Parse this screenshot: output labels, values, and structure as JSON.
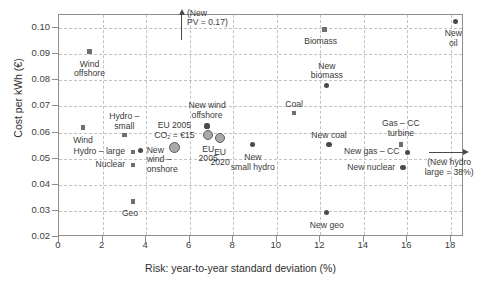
{
  "chart_data": {
    "type": "scatter",
    "title": "",
    "xlabel": "Risk: year-to-year standard deviation (%)",
    "ylabel": "Cost per kWh (€)",
    "xlim": [
      0,
      18.6
    ],
    "ylim": [
      0.02,
      0.105
    ],
    "grid": true,
    "legend": "none",
    "xticks": [
      "0",
      "2",
      "4",
      "6",
      "8",
      "10",
      "12",
      "14",
      "16",
      "18"
    ],
    "xtick_values": [
      0,
      2,
      4,
      6,
      8,
      10,
      12,
      14,
      16,
      18
    ],
    "yticks": [
      "0.10",
      "0.09",
      "0.08",
      "0.07",
      "0.06",
      "0.05",
      "0.04",
      "0.03",
      "0.02"
    ],
    "ytick_values": [
      0.1,
      0.09,
      0.08,
      0.07,
      0.06,
      0.05,
      0.04,
      0.03,
      0.02
    ],
    "series": [
      {
        "name": "Existing technologies",
        "marker": "square",
        "color": "#6e6e6e",
        "points": [
          {
            "label": "Wind\noffshore",
            "x": 1.4,
            "y": 0.091,
            "label_pos": "below",
            "label_dx": 0,
            "label_dy": 6
          },
          {
            "label": "Wind",
            "x": 1.1,
            "y": 0.062,
            "label_pos": "below",
            "label_dx": 0,
            "label_dy": 6
          },
          {
            "label": "Hydro –\nsmall",
            "x": 3.0,
            "y": 0.059,
            "label_pos": "above",
            "label_dx": 0,
            "label_dy": -23
          },
          {
            "label": "Hydro – large",
            "x": 3.4,
            "y": 0.0525,
            "label_pos": "left",
            "label_dx": -6,
            "label_dy": -5
          },
          {
            "label": "Nuclear",
            "x": 3.4,
            "y": 0.0475,
            "label_pos": "left",
            "label_dx": -6,
            "label_dy": -5
          },
          {
            "label": "Geo",
            "x": 3.4,
            "y": 0.0335,
            "label_pos": "below",
            "label_dx": -3,
            "label_dy": 5
          },
          {
            "label": "Biomass",
            "x": 12.2,
            "y": 0.0995,
            "label_pos": "below",
            "label_dx": -4,
            "label_dy": 5
          },
          {
            "label": "Coal",
            "x": 10.8,
            "y": 0.0675,
            "label_pos": "above",
            "label_dx": 0,
            "label_dy": -13
          },
          {
            "label": "Gas – CC\nturbine",
            "x": 15.7,
            "y": 0.0555,
            "label_pos": "above",
            "label_dx": 0,
            "label_dy": -25
          }
        ]
      },
      {
        "name": "New technologies",
        "marker": "circle",
        "color": "#4a4a4a",
        "points": [
          {
            "label": "New\nwind –\nonshore",
            "x": 3.75,
            "y": 0.053,
            "label_pos": "right",
            "label_dx": 6,
            "label_dy": -5
          },
          {
            "label": "New wind\noffshore",
            "x": 6.8,
            "y": 0.0625,
            "label_pos": "above",
            "label_dx": 0,
            "label_dy": -25
          },
          {
            "label": "New\nsmall hydro",
            "x": 8.9,
            "y": 0.0555,
            "label_pos": "below",
            "label_dx": 0,
            "label_dy": 6
          },
          {
            "label": "New\nbiomass",
            "x": 12.3,
            "y": 0.078,
            "label_pos": "above",
            "label_dx": 0,
            "label_dy": -24
          },
          {
            "label": "New coal",
            "x": 12.4,
            "y": 0.0555,
            "label_pos": "above",
            "label_dx": 0,
            "label_dy": -13
          },
          {
            "label": "New geo",
            "x": 12.3,
            "y": 0.0295,
            "label_pos": "below",
            "label_dx": 0,
            "label_dy": 6
          },
          {
            "label": "New gas – CC",
            "x": 16.0,
            "y": 0.0525,
            "label_pos": "left",
            "label_dx": -6,
            "label_dy": -5
          },
          {
            "label": "New nuclear",
            "x": 15.8,
            "y": 0.0465,
            "label_pos": "left",
            "label_dx": -6,
            "label_dy": -5
          },
          {
            "label": "New\noil",
            "x": 18.2,
            "y": 0.1025,
            "label_pos": "below",
            "label_dx": -2,
            "label_dy": 5
          }
        ]
      },
      {
        "name": "EU portfolios",
        "marker": "bigcircle",
        "color": "#a9a9a9",
        "points": [
          {
            "label": "EU 2005\nCO₂ = €15",
            "x": 5.3,
            "y": 0.0543,
            "label_pos": "above",
            "label_dx": 0,
            "label_dy": -26,
            "size": 11
          },
          {
            "label": "EU\n2005",
            "x": 6.85,
            "y": 0.0592,
            "label_pos": "below",
            "label_dx": 0,
            "label_dy": 5,
            "size": 10
          },
          {
            "label": "EU\n2020",
            "x": 7.4,
            "y": 0.0578,
            "label_pos": "below",
            "label_dx": 0,
            "label_dy": 5,
            "size": 10
          }
        ]
      }
    ],
    "annotations": [
      {
        "id": "new-pv",
        "text": "(New\nPV = 0.17)",
        "x": 5.6,
        "y": 0.0955,
        "arrow": "up",
        "arrow_length_px": 26,
        "text_dx": 6,
        "text_dy": -9
      },
      {
        "id": "new-hydro-large",
        "text": "(New hydro\nlarge = 38%)",
        "x": 17.0,
        "y": 0.0525,
        "arrow": "right",
        "arrow_length_px": 34,
        "text_dx": -6,
        "text_dy": 6
      }
    ]
  }
}
